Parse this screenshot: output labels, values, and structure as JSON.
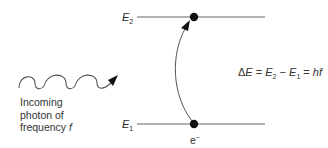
{
  "diagram": {
    "type": "energy-level-absorption",
    "levels": [
      {
        "id": "upper",
        "symbol": "E",
        "subscript": "2",
        "y": 17
      },
      {
        "id": "lower",
        "symbol": "E",
        "subscript": "1",
        "y": 124
      }
    ],
    "photon": {
      "label_lines": [
        "Incoming",
        "photon of",
        "frequency "
      ],
      "frequency_symbol": "f"
    },
    "electron": {
      "symbol": "e",
      "charge": "−"
    },
    "equation": {
      "delta": "Δ",
      "E": "E",
      "eq1": " = ",
      "E2": "E",
      "sub2": "2",
      "minus": " − ",
      "E1": "E",
      "sub1": "1",
      "eq2": " = ",
      "rhs": "hf"
    },
    "colors": {
      "line": "#555555",
      "dot": "#111111",
      "text": "#2a2a2a"
    }
  }
}
